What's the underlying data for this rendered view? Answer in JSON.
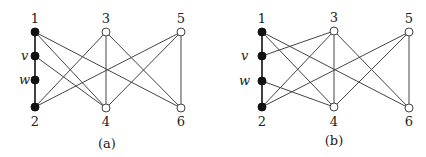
{
  "figures": [
    {
      "id": "a",
      "caption": "(a)",
      "caption_pos": {
        "x": 107,
        "y": 148
      },
      "nodes": [
        {
          "id": "1",
          "label": "1",
          "x": 35,
          "y": 32,
          "filled": true,
          "label_dx": 0,
          "label_dy": -9,
          "italic": false
        },
        {
          "id": "v",
          "label": "v",
          "x": 35,
          "y": 56,
          "filled": true,
          "label_dx": -12,
          "label_dy": 4,
          "italic": true
        },
        {
          "id": "w",
          "label": "w",
          "x": 35,
          "y": 80,
          "filled": true,
          "label_dx": -14,
          "label_dy": 4,
          "italic": true
        },
        {
          "id": "2",
          "label": "2",
          "x": 35,
          "y": 107,
          "filled": true,
          "label_dx": 0,
          "label_dy": 19,
          "italic": false
        },
        {
          "id": "3",
          "label": "3",
          "x": 106,
          "y": 32,
          "filled": false,
          "label_dx": -5,
          "label_dy": -9,
          "italic": false
        },
        {
          "id": "4",
          "label": "4",
          "x": 106,
          "y": 108,
          "filled": false,
          "label_dx": -2,
          "label_dy": 18,
          "italic": false
        },
        {
          "id": "5",
          "label": "5",
          "x": 181,
          "y": 32,
          "filled": false,
          "label_dx": -3,
          "label_dy": -9,
          "italic": false
        },
        {
          "id": "6",
          "label": "6",
          "x": 181,
          "y": 108,
          "filled": false,
          "label_dx": -3,
          "label_dy": 18,
          "italic": false
        }
      ],
      "path_edges": [
        [
          "1",
          "v"
        ],
        [
          "v",
          "w"
        ],
        [
          "w",
          "2"
        ]
      ],
      "edges": [
        [
          "1",
          "4"
        ],
        [
          "1",
          "6"
        ],
        [
          "v",
          "4"
        ],
        [
          "2",
          "3"
        ],
        [
          "2",
          "5"
        ],
        [
          "3",
          "4"
        ],
        [
          "3",
          "6"
        ],
        [
          "4",
          "5"
        ],
        [
          "5",
          "6"
        ]
      ]
    },
    {
      "id": "b",
      "caption": "(b)",
      "caption_pos": {
        "x": 334,
        "y": 145
      },
      "nodes": [
        {
          "id": "1",
          "label": "1",
          "x": 262,
          "y": 32,
          "filled": true,
          "label_dx": -5,
          "label_dy": -9,
          "italic": false
        },
        {
          "id": "v",
          "label": "v",
          "x": 262,
          "y": 56,
          "filled": true,
          "label_dx": -19,
          "label_dy": 4,
          "italic": true
        },
        {
          "id": "w",
          "label": "w",
          "x": 262,
          "y": 81,
          "filled": true,
          "label_dx": -21,
          "label_dy": 4,
          "italic": true
        },
        {
          "id": "2",
          "label": "2",
          "x": 262,
          "y": 107,
          "filled": true,
          "label_dx": -5,
          "label_dy": 19,
          "italic": false
        },
        {
          "id": "3",
          "label": "3",
          "x": 334,
          "y": 31,
          "filled": false,
          "label_dx": -5,
          "label_dy": -9,
          "italic": false
        },
        {
          "id": "4",
          "label": "4",
          "x": 334,
          "y": 107,
          "filled": false,
          "label_dx": -5,
          "label_dy": 19,
          "italic": false
        },
        {
          "id": "5",
          "label": "5",
          "x": 409,
          "y": 32,
          "filled": false,
          "label_dx": -6,
          "label_dy": -9,
          "italic": false
        },
        {
          "id": "6",
          "label": "6",
          "x": 409,
          "y": 108,
          "filled": false,
          "label_dx": -6,
          "label_dy": 18,
          "italic": false
        }
      ],
      "path_edges": [
        [
          "1",
          "v"
        ],
        [
          "v",
          "w"
        ],
        [
          "w",
          "2"
        ]
      ],
      "edges": [
        [
          "1",
          "4"
        ],
        [
          "1",
          "6"
        ],
        [
          "v",
          "3"
        ],
        [
          "w",
          "4"
        ],
        [
          "2",
          "3"
        ],
        [
          "2",
          "5"
        ],
        [
          "3",
          "4"
        ],
        [
          "3",
          "6"
        ],
        [
          "4",
          "5"
        ],
        [
          "5",
          "6"
        ]
      ]
    }
  ],
  "style": {
    "node_radius": 4,
    "filled_color": "#111111",
    "open_fill": "#ffffff",
    "stroke_color": "#444444"
  }
}
